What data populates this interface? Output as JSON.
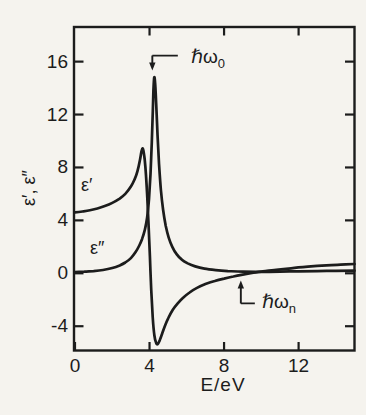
{
  "figure": {
    "background_color": "#f5f3ee",
    "ink_color": "#1c1c1c",
    "y_axis_label": "ε′, ε″",
    "x_axis_label": "E/eV",
    "curve_labels": {
      "real": "ε′",
      "imag": "ε″"
    },
    "annotations": {
      "omega0": {
        "base": "ℏω",
        "sub": "0"
      },
      "omegan": {
        "base": "ℏω",
        "sub": "n"
      }
    }
  },
  "chart_data": {
    "type": "line",
    "xlabel": "E/eV",
    "ylabel": "ε′, ε″",
    "xlim": [
      0,
      15
    ],
    "ylim": [
      -5.8,
      18.6
    ],
    "xticks": [
      0,
      4,
      8,
      12
    ],
    "yticks": [
      16,
      12,
      8,
      4,
      0,
      -4
    ],
    "grid": false,
    "legend_position": "none (curves labeled inline)",
    "frame": "full box with mirrored inward ticks on all four sides",
    "series": [
      {
        "name": "ε′",
        "description": "real part of dielectric function",
        "points": [
          [
            0,
            4.6
          ],
          [
            0.4,
            4.67
          ],
          [
            0.8,
            4.77
          ],
          [
            1.2,
            4.9
          ],
          [
            1.6,
            5.08
          ],
          [
            2.0,
            5.32
          ],
          [
            2.4,
            5.65
          ],
          [
            2.7,
            6.0
          ],
          [
            3.0,
            6.55
          ],
          [
            3.2,
            7.1
          ],
          [
            3.35,
            7.7
          ],
          [
            3.48,
            8.5
          ],
          [
            3.56,
            9.15
          ],
          [
            3.62,
            9.45
          ],
          [
            3.68,
            9.2
          ],
          [
            3.74,
            8.6
          ],
          [
            3.81,
            7.4
          ],
          [
            3.88,
            5.7
          ],
          [
            3.95,
            3.6
          ],
          [
            4.02,
            1.3
          ],
          [
            4.09,
            -1.2
          ],
          [
            4.17,
            -3.3
          ],
          [
            4.26,
            -4.7
          ],
          [
            4.35,
            -5.25
          ],
          [
            4.44,
            -5.35
          ],
          [
            4.55,
            -5.05
          ],
          [
            4.68,
            -4.55
          ],
          [
            4.82,
            -4.0
          ],
          [
            5.0,
            -3.4
          ],
          [
            5.25,
            -2.75
          ],
          [
            5.5,
            -2.3
          ],
          [
            5.8,
            -1.85
          ],
          [
            6.15,
            -1.45
          ],
          [
            6.55,
            -1.1
          ],
          [
            7.0,
            -0.82
          ],
          [
            7.5,
            -0.58
          ],
          [
            8.0,
            -0.4
          ],
          [
            8.5,
            -0.24
          ],
          [
            9.0,
            -0.1
          ],
          [
            9.5,
            0.02
          ],
          [
            10.0,
            0.12
          ],
          [
            10.8,
            0.26
          ],
          [
            11.6,
            0.38
          ],
          [
            12.5,
            0.5
          ],
          [
            13.5,
            0.6
          ],
          [
            14.25,
            0.65
          ],
          [
            15,
            0.7
          ]
        ]
      },
      {
        "name": "ε″",
        "description": "imaginary part of dielectric function",
        "points": [
          [
            0,
            0.1
          ],
          [
            0.5,
            0.13
          ],
          [
            1.0,
            0.17
          ],
          [
            1.5,
            0.25
          ],
          [
            2.0,
            0.4
          ],
          [
            2.4,
            0.6
          ],
          [
            2.7,
            0.82
          ],
          [
            3.0,
            1.15
          ],
          [
            3.25,
            1.6
          ],
          [
            3.45,
            2.1
          ],
          [
            3.6,
            2.6
          ],
          [
            3.75,
            3.3
          ],
          [
            3.87,
            4.2
          ],
          [
            3.97,
            5.6
          ],
          [
            4.05,
            7.5
          ],
          [
            4.12,
            9.9
          ],
          [
            4.17,
            12.0
          ],
          [
            4.21,
            13.8
          ],
          [
            4.25,
            14.8
          ],
          [
            4.3,
            14.4
          ],
          [
            4.36,
            12.8
          ],
          [
            4.43,
            10.5
          ],
          [
            4.51,
            8.3
          ],
          [
            4.61,
            6.3
          ],
          [
            4.73,
            4.8
          ],
          [
            4.87,
            3.6
          ],
          [
            5.03,
            2.7
          ],
          [
            5.22,
            2.0
          ],
          [
            5.45,
            1.45
          ],
          [
            5.72,
            1.05
          ],
          [
            6.05,
            0.75
          ],
          [
            6.45,
            0.52
          ],
          [
            6.95,
            0.35
          ],
          [
            7.55,
            0.24
          ],
          [
            8.2,
            0.17
          ],
          [
            9.0,
            0.12
          ],
          [
            10.0,
            0.11
          ],
          [
            11.0,
            0.13
          ],
          [
            12.0,
            0.15
          ],
          [
            13.0,
            0.17
          ],
          [
            14.0,
            0.19
          ],
          [
            15,
            0.2
          ]
        ]
      }
    ],
    "annotations": [
      {
        "label": "ℏω0",
        "x": 4.15,
        "arrow": "down",
        "marks": "ε″ resonance peak (≈14.8 at ≈4.2 eV)"
      },
      {
        "label": "ℏωn",
        "x": 8.9,
        "arrow": "up",
        "marks": "ε′ zero crossing (≈9 eV)"
      }
    ]
  }
}
